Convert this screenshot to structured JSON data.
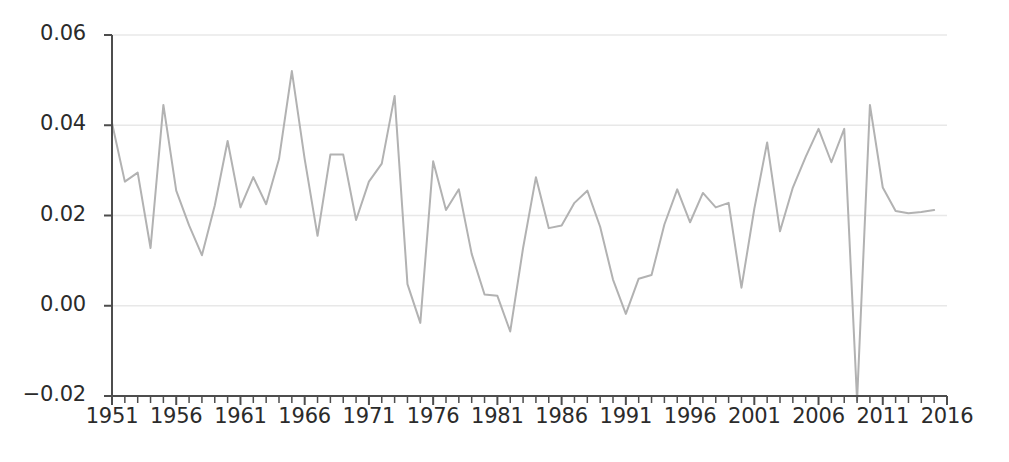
{
  "chart_data": {
    "type": "line",
    "title": "",
    "subtitle": "",
    "xlabel": "",
    "ylabel": "",
    "xlim": [
      1951,
      2016
    ],
    "ylim": [
      -0.02,
      0.06
    ],
    "grid": true,
    "grid_axis": "y",
    "legend": false,
    "legend_position": "none",
    "line_color": "#b2b2b2",
    "line_width": 2,
    "axis_color": "#4d4d4d",
    "grid_color": "#e8e8e8",
    "tick_label_color": "#2b2b2b",
    "background_color": "#ffffff",
    "y_ticks": [
      -0.02,
      0.0,
      0.02,
      0.04,
      0.06
    ],
    "y_tick_labels": [
      "−0.02",
      "0.00",
      "0.02",
      "0.04",
      "0.06"
    ],
    "x_ticks": [
      1951,
      1956,
      1961,
      1966,
      1971,
      1976,
      1981,
      1986,
      1991,
      1996,
      2001,
      2006,
      2011,
      2016
    ],
    "x_tick_labels": [
      "1951",
      "1956",
      "1961",
      "1966",
      "1971",
      "1976",
      "1981",
      "1986",
      "1991",
      "1996",
      "2001",
      "2006",
      "2011",
      "2016"
    ],
    "x_minor_tick_step": 1,
    "x": [
      1951,
      1952,
      1953,
      1954,
      1955,
      1956,
      1957,
      1958,
      1959,
      1960,
      1961,
      1962,
      1963,
      1964,
      1965,
      1966,
      1967,
      1968,
      1969,
      1970,
      1971,
      1972,
      1973,
      1974,
      1975,
      1976,
      1977,
      1978,
      1979,
      1980,
      1981,
      1982,
      1983,
      1984,
      1985,
      1986,
      1987,
      1988,
      1989,
      1990,
      1991,
      1992,
      1993,
      1994,
      1995,
      1996,
      1997,
      1998,
      1999,
      2000,
      2001,
      2002,
      2003,
      2004,
      2005,
      2006,
      2007,
      2008,
      2009,
      2010,
      2011,
      2012,
      2013,
      2014,
      2015
    ],
    "values": [
      0.0405,
      0.0275,
      0.0295,
      0.0128,
      0.0445,
      0.0255,
      0.0178,
      0.0112,
      0.0222,
      0.0365,
      0.0218,
      0.0285,
      0.0225,
      0.0325,
      0.052,
      0.0325,
      0.0155,
      0.0335,
      0.0335,
      0.019,
      0.0275,
      0.0315,
      0.0465,
      0.0048,
      -0.0038,
      0.032,
      0.0212,
      0.0258,
      0.0115,
      0.0025,
      0.0022,
      -0.0057,
      0.0128,
      0.0285,
      0.0172,
      0.0178,
      0.0228,
      0.0255,
      0.0175,
      0.0058,
      -0.0018,
      0.006,
      0.0068,
      0.018,
      0.0258,
      0.0185,
      0.025,
      0.0218,
      0.0228,
      0.004,
      0.0215,
      0.0362,
      0.0165,
      0.0262,
      0.033,
      0.0392,
      0.0318,
      0.0392,
      -0.021,
      0.0445,
      0.0262,
      0.021,
      0.0205,
      0.0208,
      0.0212
    ]
  }
}
